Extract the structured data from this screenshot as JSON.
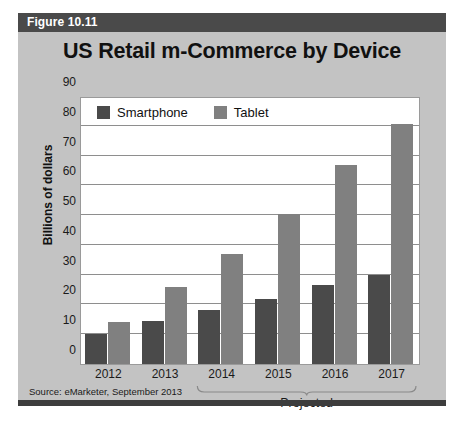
{
  "figure": {
    "header_label": "Figure 10.11",
    "source_note": "Source: eMarketer, September 2013"
  },
  "chart_data": {
    "type": "bar",
    "title": "US Retail m-Commerce by Device",
    "xlabel": "",
    "ylabel": "Billions of dollars",
    "categories": [
      "2012",
      "2013",
      "2014",
      "2015",
      "2016",
      "2017"
    ],
    "series": [
      {
        "name": "Smartphone",
        "color": "#4a4a4a",
        "values": [
          10,
          14.5,
          18,
          22,
          26.5,
          30
        ]
      },
      {
        "name": "Tablet",
        "color": "#808080",
        "values": [
          14,
          26,
          37,
          50.5,
          67,
          80.5
        ]
      }
    ],
    "ylim": [
      0,
      90
    ],
    "yticks": [
      0,
      10,
      20,
      30,
      40,
      50,
      60,
      70,
      80,
      90
    ],
    "ytick_labels": [
      "0",
      "10",
      "20",
      "30",
      "40",
      "50",
      "60",
      "70",
      "80",
      "90"
    ],
    "grid": true,
    "legend_position": "top-left",
    "annotations": [
      {
        "label": "Projected",
        "spans_categories": [
          "2014",
          "2015",
          "2016",
          "2017"
        ]
      }
    ]
  },
  "colors": {
    "card_background": "#c3c3c3",
    "header_bar": "#4a4a4a",
    "plot_background": "#ffffff",
    "gridline": "#8e8e8e",
    "footer_bar": "#3d3d3d"
  }
}
